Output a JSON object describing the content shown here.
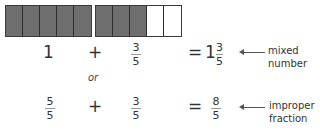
{
  "bars": [
    {
      "cells": 5,
      "filled": 5
    },
    {
      "cells": 5,
      "filled": 3
    }
  ],
  "row1": {
    "whole": "1",
    "plus": "+",
    "frac": {
      "num": "3",
      "den": "5"
    },
    "equals": "=",
    "result_whole": "1",
    "result_frac": {
      "num": "3",
      "den": "5"
    },
    "label_line1": "mixed",
    "label_line2": "number"
  },
  "or_text": "or",
  "row2": {
    "frac1": {
      "num": "5",
      "den": "5"
    },
    "plus": "+",
    "frac2": {
      "num": "3",
      "den": "5"
    },
    "equals": "=",
    "result_frac": {
      "num": "8",
      "den": "5"
    },
    "label_line1": "improper",
    "label_line2": "fraction"
  },
  "colors": {
    "filled": "#6e6e6e",
    "empty": "#ffffff",
    "border": "#2e2e2e"
  }
}
